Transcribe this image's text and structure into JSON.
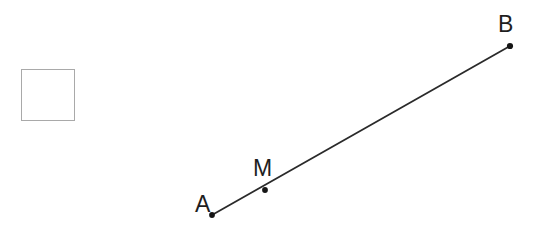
{
  "figure": {
    "background_color": "#ffffff",
    "width": 547,
    "height": 239,
    "answer_box": {
      "name": "empty-answer-box",
      "x": 21,
      "y": 69,
      "width": 53,
      "height": 51,
      "stroke_color": "#a9a9a9",
      "stroke_width": 1,
      "fill": "none"
    },
    "segment": {
      "name": "segment-AB",
      "from": "A",
      "to": "B",
      "color": "#2a2a2a",
      "stroke_width": 1.8
    },
    "points": [
      {
        "id": "A",
        "label": "A",
        "x": 212,
        "y": 215,
        "radius": 2.9,
        "color": "#151515",
        "label_x": 195,
        "label_y": 193
      },
      {
        "id": "M",
        "label": "M",
        "x": 265,
        "y": 190,
        "radius": 2.9,
        "color": "#151515",
        "label_x": 253,
        "label_y": 157
      },
      {
        "id": "B",
        "label": "B",
        "x": 510,
        "y": 46,
        "radius": 3.1,
        "color": "#151515",
        "label_x": 498,
        "label_y": 13
      }
    ]
  }
}
